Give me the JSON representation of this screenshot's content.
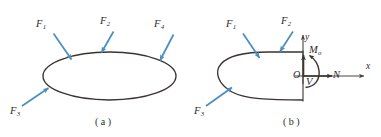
{
  "figure": {
    "colors": {
      "force_arrow": "#4a8fc0",
      "body_outline": "#3a3330",
      "axis": "#4a4440",
      "internal_arrow": "#3c3632",
      "text": "#2b2b2b",
      "background": "#ffffff"
    },
    "panels": [
      {
        "id": "a",
        "caption": "( a )",
        "shape": "ellipse",
        "forces": [
          {
            "name": "F1",
            "base": "F",
            "sub": "1"
          },
          {
            "name": "F2",
            "base": "F",
            "sub": "2"
          },
          {
            "name": "F4",
            "base": "F",
            "sub": "4"
          },
          {
            "name": "F3",
            "base": "F",
            "sub": "3"
          }
        ]
      },
      {
        "id": "b",
        "caption": "( b )",
        "shape": "half-ellipse-cut",
        "forces": [
          {
            "name": "F1",
            "base": "F",
            "sub": "1"
          },
          {
            "name": "F2",
            "base": "F",
            "sub": "2"
          },
          {
            "name": "F3",
            "base": "F",
            "sub": "3"
          }
        ],
        "axes": [
          {
            "name": "x-axis-label",
            "base": "x",
            "sub": ""
          },
          {
            "name": "y-axis-label",
            "base": "y",
            "sub": ""
          }
        ],
        "origin": {
          "base": "O",
          "sub": ""
        },
        "internal_resultants": [
          {
            "name": "moment",
            "base": "M",
            "sub": "o"
          },
          {
            "name": "normal-force",
            "base": "N",
            "sub": ""
          },
          {
            "name": "shear-force",
            "base": "V",
            "sub": ""
          }
        ]
      }
    ]
  }
}
